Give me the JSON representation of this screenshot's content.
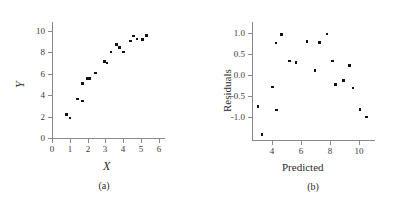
{
  "figure": {
    "panels": [
      {
        "caption": "(a)",
        "chart_data": {
          "type": "scatter",
          "title": "",
          "xlabel": "X",
          "ylabel": "Y",
          "xlim": [
            0,
            6.3
          ],
          "ylim": [
            0,
            10.8
          ],
          "xticks": [
            "0",
            "1",
            "2",
            "3",
            "4",
            "5",
            "6"
          ],
          "xtick_values": [
            0,
            1,
            2,
            3,
            4,
            5,
            6
          ],
          "yticks": [
            "0",
            "2",
            "4",
            "6",
            "8",
            "10"
          ],
          "ytick_values": [
            0,
            2,
            4,
            6,
            8,
            10
          ],
          "grid": false,
          "legend": "none",
          "marker": "square",
          "marker_color": "#111111",
          "x": [
            0.82,
            1.02,
            1.45,
            1.7,
            1.72,
            2.0,
            2.12,
            2.45,
            2.95,
            3.1,
            3.32,
            3.62,
            3.8,
            4.02,
            4.42,
            4.6,
            4.78,
            5.08,
            5.32
          ],
          "y": [
            2.2,
            1.85,
            3.62,
            3.45,
            5.05,
            5.55,
            5.52,
            6.05,
            7.1,
            7.0,
            8.0,
            8.7,
            8.45,
            8.02,
            9.05,
            9.5,
            9.2,
            9.18,
            9.52
          ]
        }
      },
      {
        "caption": "(b)",
        "chart_data": {
          "type": "scatter",
          "title": "",
          "xlabel": "Predicted",
          "ylabel": "Residuals",
          "xlim": [
            2.6,
            11.0
          ],
          "ylim": [
            -1.55,
            1.25
          ],
          "xticks": [
            "4",
            "6",
            "8",
            "10"
          ],
          "xtick_values": [
            4,
            6,
            8,
            10
          ],
          "yticks": [
            "1.0",
            "0.5",
            "0.0",
            "-0.5",
            "-1.0"
          ],
          "ytick_values": [
            1.0,
            0.5,
            0.0,
            -0.5,
            -1.0
          ],
          "grid": false,
          "legend": "none",
          "marker": "square",
          "marker_color": "#111111",
          "x": [
            3.0,
            3.3,
            4.0,
            4.25,
            4.3,
            4.62,
            5.2,
            5.62,
            6.38,
            6.95,
            7.25,
            7.75,
            8.15,
            8.35,
            8.9,
            9.3,
            9.55,
            10.05,
            10.5
          ],
          "y": [
            -0.76,
            -1.42,
            -0.29,
            0.75,
            -0.84,
            0.95,
            0.32,
            0.29,
            0.79,
            0.1,
            0.77,
            0.97,
            0.32,
            -0.24,
            -0.14,
            0.22,
            -0.32,
            -0.82,
            -1.0
          ]
        }
      }
    ]
  }
}
